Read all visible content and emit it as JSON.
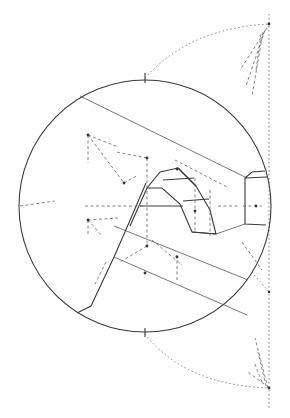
{
  "figure": {
    "caption_fragment": ""
  },
  "colors": {
    "background": "#ffffff",
    "line": "#3a3a3a",
    "construction": "#666666"
  },
  "geometry": {
    "circle": {
      "cx": 145,
      "cy": 206,
      "r": 126
    },
    "reference_line_x": 268
  }
}
